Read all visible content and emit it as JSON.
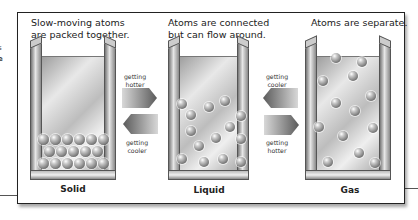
{
  "diagram": {
    "states": [
      {
        "name": "Solid",
        "caption_line1": "Slow-moving atoms",
        "caption_line2": "are packed together."
      },
      {
        "name": "Liquid",
        "caption_line1": "Atoms are connected",
        "caption_line2": "but can flow around."
      },
      {
        "name": "Gas",
        "caption_line1": "Atoms are separate.",
        "caption_line2": ""
      }
    ],
    "transitions": [
      {
        "from": "Solid",
        "to": "Liquid",
        "label_line1": "getting",
        "label_line2": "hotter",
        "direction": "right"
      },
      {
        "from": "Liquid",
        "to": "Solid",
        "label_line1": "getting",
        "label_line2": "cooler",
        "direction": "left"
      },
      {
        "from": "Gas",
        "to": "Liquid",
        "label_line1": "getting",
        "label_line2": "cooler",
        "direction": "left"
      },
      {
        "from": "Liquid",
        "to": "Gas",
        "label_line1": "getting",
        "label_line2": "hotter",
        "direction": "right"
      }
    ],
    "edge_fragments": [
      "s",
      "e"
    ]
  },
  "colors": {
    "frame_border": "#222222",
    "atom": "#7a7a7a",
    "container": "#bdbdbd"
  }
}
